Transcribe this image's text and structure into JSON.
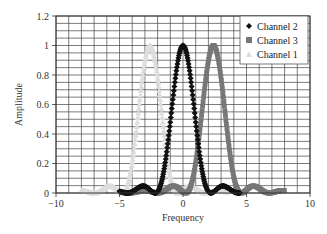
{
  "chart_data": {
    "type": "scatter",
    "title": "",
    "xlabel": "Frequency",
    "ylabel": "Amplitude",
    "xlim": [
      -10,
      10
    ],
    "ylim": [
      0,
      1.2
    ],
    "x_ticks": [
      -10,
      -5,
      0,
      5,
      10
    ],
    "x_tick_labels": [
      "−10",
      "−5",
      "0",
      "5",
      "10"
    ],
    "y_ticks": [
      0,
      0.2,
      0.4,
      0.6,
      0.8,
      1,
      1.2
    ],
    "y_tick_labels": [
      "0",
      "0.2",
      "0.4",
      "0.6",
      "0.8",
      "1",
      "1.2"
    ],
    "grid": {
      "on": true,
      "x_step": 1,
      "y_step": 0.05
    },
    "legend_position": "upper right",
    "x": [
      -5,
      -4.5,
      -4,
      -3.5,
      -3,
      -2.5,
      -2,
      -1.5,
      -1,
      -0.5,
      0,
      0.5,
      1,
      1.5,
      2,
      2.5,
      3,
      3.5,
      4,
      4.5,
      5
    ],
    "series": [
      {
        "name": "Channel 2",
        "marker": "diamond",
        "color": "#111111",
        "center": 0,
        "null_width": 2.2,
        "x_range": [
          -5,
          4.5
        ],
        "values": [
          0.011,
          0.001,
          0.009,
          0.037,
          0.045,
          0.014,
          0.01,
          0.154,
          0.481,
          0.841,
          1.0,
          0.841,
          0.481,
          0.154,
          0.01,
          0.014,
          0.045,
          0.037,
          0.009,
          0.001,
          0.011
        ]
      },
      {
        "name": "Channel 3",
        "marker": "square",
        "color": "#777777",
        "center": 2.4,
        "null_width": 2.2,
        "x_range": [
          -4.5,
          8
        ]
      },
      {
        "name": "Channel 1",
        "marker": "triangle",
        "color": "#dddddd",
        "center": -2.6,
        "null_width": 2.2,
        "x_range": [
          -8,
          3.5
        ]
      }
    ]
  },
  "legend": {
    "items": [
      {
        "label": "Channel 2",
        "marker": "diamond",
        "color": "#111111"
      },
      {
        "label": "Channel 3",
        "marker": "square",
        "color": "#777777"
      },
      {
        "label": "Channel 1",
        "marker": "triangle",
        "color": "#dddddd"
      }
    ]
  }
}
